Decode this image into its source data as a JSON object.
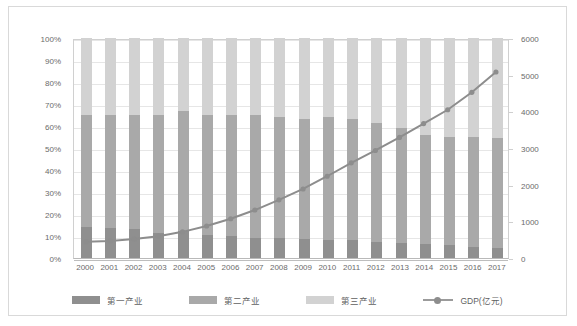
{
  "chart_data": {
    "type": "bar",
    "title": "",
    "subtitle": "",
    "xlabel": "",
    "ylabel": "",
    "stacked": true,
    "categories": [
      "2000",
      "2001",
      "2002",
      "2003",
      "2004",
      "2005",
      "2006",
      "2007",
      "2008",
      "2009",
      "2010",
      "2011",
      "2012",
      "2013",
      "2014",
      "2015",
      "2016",
      "2017"
    ],
    "left_axis": {
      "label": "",
      "ylim": [
        0,
        100
      ],
      "unit": "%",
      "tick_labels": [
        "0%",
        "10%",
        "20%",
        "30%",
        "40%",
        "50%",
        "60%",
        "70%",
        "80%",
        "90%",
        "100%"
      ],
      "tick_values": [
        0,
        10,
        20,
        30,
        40,
        50,
        60,
        70,
        80,
        90,
        100
      ],
      "grid": true
    },
    "right_axis": {
      "label": "GDP(亿元)",
      "ylim": [
        0,
        6000
      ],
      "tick_labels": [
        "0",
        "1000",
        "2000",
        "3000",
        "4000",
        "5000",
        "6000"
      ],
      "tick_values": [
        0,
        1000,
        2000,
        3000,
        4000,
        5000,
        6000
      ],
      "grid": false
    },
    "series": [
      {
        "name": "第一产业",
        "type": "bar",
        "axis": "left",
        "color": "#8f8f8f",
        "values": [
          14.0,
          13.5,
          13.0,
          11.5,
          12.5,
          10.5,
          10.0,
          9.0,
          9.0,
          8.5,
          8.0,
          8.0,
          7.5,
          7.0,
          6.5,
          6.0,
          5.0,
          4.5
        ]
      },
      {
        "name": "第二产业",
        "type": "bar",
        "axis": "left",
        "color": "#a9a9a9",
        "values": [
          51.0,
          51.5,
          52.0,
          53.5,
          54.5,
          54.5,
          55.0,
          56.0,
          55.0,
          54.5,
          56.0,
          55.0,
          54.0,
          52.0,
          49.5,
          49.0,
          50.0,
          50.0
        ]
      },
      {
        "name": "第三产业",
        "type": "bar",
        "axis": "left",
        "color": "#d2d2d2",
        "values": [
          35.0,
          35.0,
          35.0,
          35.0,
          33.0,
          35.0,
          35.0,
          35.0,
          36.0,
          37.0,
          36.0,
          37.0,
          38.5,
          41.0,
          44.0,
          45.0,
          45.0,
          45.5
        ]
      },
      {
        "name": "GDP(亿元)",
        "type": "line",
        "axis": "right",
        "color": "#8d8d8d",
        "values": [
          450,
          470,
          520,
          600,
          720,
          880,
          1080,
          1320,
          1600,
          1900,
          2250,
          2620,
          2960,
          3320,
          3700,
          4080,
          4560,
          5120
        ]
      }
    ],
    "legend": {
      "position": "bottom",
      "entries": [
        "第一产业",
        "第二产业",
        "第三产业",
        "GDP(亿元)"
      ]
    }
  },
  "legend_labels": {
    "s1": "第一产业",
    "s2": "第二产业",
    "s3": "第三产业",
    "gdp": "GDP(亿元)"
  }
}
